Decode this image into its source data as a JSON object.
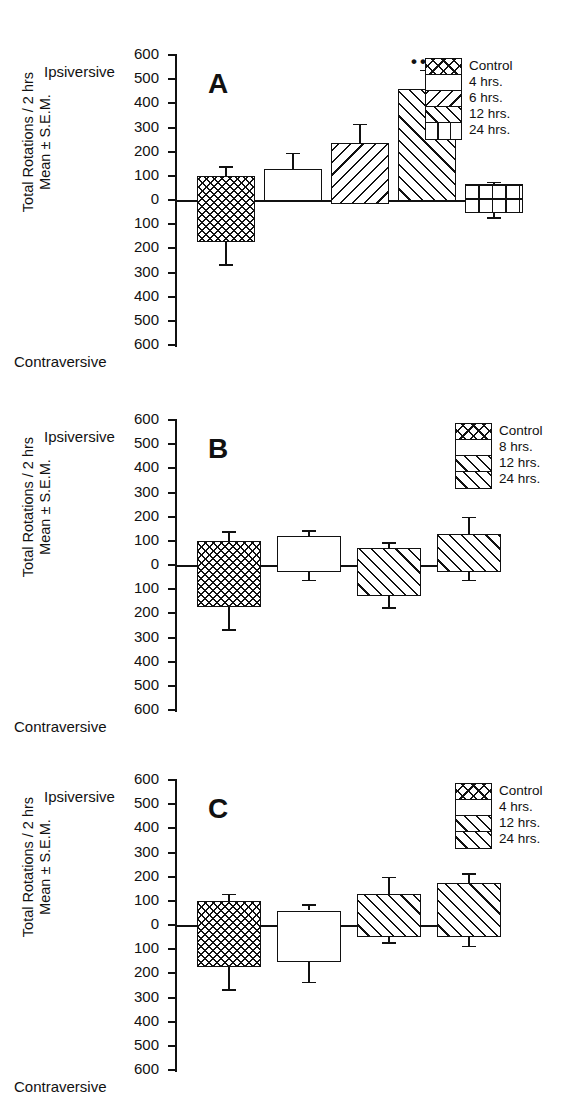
{
  "figure": {
    "axis_title_line1": "Total Rotations / 2 hrs",
    "axis_title_line2": "Mean ± S.E.M.",
    "top_label": "Ipsiversive",
    "bottom_label": "Contraversive",
    "tick_labels": [
      "600",
      "500",
      "400",
      "300",
      "200",
      "100",
      "0",
      "100",
      "200",
      "300",
      "400",
      "500",
      "600"
    ],
    "tick_values": [
      600,
      500,
      400,
      300,
      200,
      100,
      0,
      -100,
      -200,
      -300,
      -400,
      -500,
      -600
    ]
  },
  "panels": {
    "a": {
      "letter": "A",
      "legend": [
        {
          "label": "Control",
          "pattern": "cross-hatch"
        },
        {
          "label": "4 hrs.",
          "pattern": "blank"
        },
        {
          "label": "6 hrs.",
          "pattern": "back-hatch"
        },
        {
          "label": "12 hrs.",
          "pattern": "forward-hatch"
        },
        {
          "label": "24 hrs.",
          "pattern": "grid"
        }
      ],
      "significance_marker": "•••",
      "significance_on": "12 hrs."
    },
    "b": {
      "letter": "B",
      "legend": [
        {
          "label": "Control",
          "pattern": "cross-hatch"
        },
        {
          "label": "8 hrs.",
          "pattern": "blank"
        },
        {
          "label": "12 hrs.",
          "pattern": "forward-hatch"
        },
        {
          "label": "24 hrs.",
          "pattern": "forward-hatch"
        }
      ]
    },
    "c": {
      "letter": "C",
      "legend": [
        {
          "label": "Control",
          "pattern": "cross-hatch"
        },
        {
          "label": "4 hrs.",
          "pattern": "blank"
        },
        {
          "label": "12 hrs.",
          "pattern": "forward-hatch"
        },
        {
          "label": "24 hrs.",
          "pattern": "forward-hatch"
        }
      ]
    }
  },
  "chart_data": [
    {
      "type": "bar",
      "panel": "A",
      "title": "A",
      "xlabel": "",
      "ylabel": "Total Rotations / 2 hrs  Mean ± S.E.M.",
      "ylim": [
        -600,
        600
      ],
      "yticks": [
        600,
        500,
        400,
        300,
        200,
        100,
        0,
        -100,
        -200,
        -300,
        -400,
        -500,
        -600
      ],
      "axis_direction_top": "Ipsiversive",
      "axis_direction_bottom": "Contraversive",
      "grid": false,
      "legend_position": "top-right",
      "categories": [
        "Control",
        "4 hrs.",
        "6 hrs.",
        "12 hrs.",
        "24 hrs."
      ],
      "bar_top": [
        100,
        130,
        235,
        460,
        65
      ],
      "bar_bottom": [
        -175,
        -5,
        -15,
        -5,
        -55
      ],
      "err_upper": [
        140,
        195,
        315,
        540,
        75
      ],
      "err_lower": [
        -265,
        -5,
        -15,
        -5,
        -70
      ],
      "patterns": [
        "cross-hatch",
        "blank",
        "back-hatch",
        "forward-hatch",
        "grid"
      ],
      "annotations": [
        {
          "text": "•••",
          "category": "12 hrs.",
          "y": 600
        }
      ]
    },
    {
      "type": "bar",
      "panel": "B",
      "title": "B",
      "xlabel": "",
      "ylabel": "Total Rotations / 2 hrs  Mean ± S.E.M.",
      "ylim": [
        -600,
        600
      ],
      "yticks": [
        600,
        500,
        400,
        300,
        200,
        100,
        0,
        -100,
        -200,
        -300,
        -400,
        -500,
        -600
      ],
      "axis_direction_top": "Ipsiversive",
      "axis_direction_bottom": "Contraversive",
      "grid": false,
      "legend_position": "top-right",
      "categories": [
        "Control",
        "8 hrs.",
        "12 hrs.",
        "24 hrs."
      ],
      "bar_top": [
        100,
        120,
        70,
        130
      ],
      "bar_bottom": [
        -175,
        -30,
        -130,
        -30
      ],
      "err_upper": [
        140,
        145,
        95,
        200
      ],
      "err_lower": [
        -265,
        -60,
        -175,
        -60
      ],
      "patterns": [
        "cross-hatch",
        "blank",
        "forward-hatch",
        "forward-hatch"
      ],
      "annotations": []
    },
    {
      "type": "bar",
      "panel": "C",
      "title": "C",
      "xlabel": "",
      "ylabel": "Total Rotations / 2 hrs  Mean ± S.E.M.",
      "ylim": [
        -600,
        600
      ],
      "yticks": [
        600,
        500,
        400,
        300,
        200,
        100,
        0,
        -100,
        -200,
        -300,
        -400,
        -500,
        -600
      ],
      "axis_direction_top": "Ipsiversive",
      "axis_direction_bottom": "Contraversive",
      "grid": false,
      "legend_position": "top-right",
      "categories": [
        "Control",
        "4 hrs.",
        "12 hrs.",
        "24 hrs."
      ],
      "bar_top": [
        100,
        60,
        130,
        175
      ],
      "bar_bottom": [
        -175,
        -155,
        -50,
        -50
      ],
      "err_upper": [
        130,
        85,
        200,
        215
      ],
      "err_lower": [
        -265,
        -235,
        -70,
        -85
      ],
      "patterns": [
        "cross-hatch",
        "blank",
        "forward-hatch",
        "forward-hatch"
      ],
      "annotations": []
    }
  ]
}
